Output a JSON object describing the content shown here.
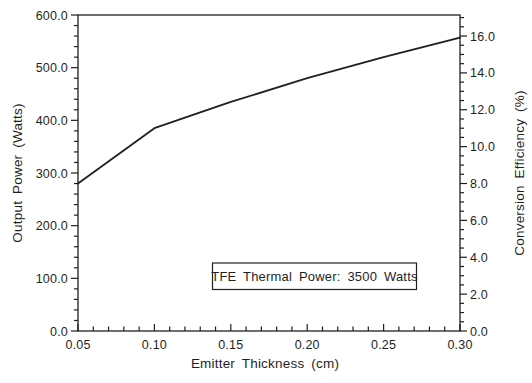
{
  "chart_data": {
    "type": "line",
    "title": "",
    "xlabel": "Emitter Thickness (cm)",
    "ylabel_left": "Output Power (Watts)",
    "ylabel_right": "Conversion Efficiency (%)",
    "annotation": "TFE Thermal Power: 3500 Watts",
    "x": [
      0.05,
      0.1,
      0.15,
      0.2,
      0.25,
      0.3
    ],
    "series": [
      {
        "name": "Output Power",
        "values": [
          280,
          385,
          435,
          480,
          520,
          557
        ]
      }
    ],
    "xlim": [
      0.05,
      0.3
    ],
    "ylim_left": [
      0.0,
      600.0
    ],
    "ylim_right": [
      0.0,
      17.14
    ],
    "x_tick_labels": [
      "0.05",
      "0.10",
      "0.15",
      "0.20",
      "0.25",
      "0.30"
    ],
    "yleft_tick_labels": [
      "0.0",
      "100.0",
      "200.0",
      "300.0",
      "400.0",
      "500.0",
      "600.0"
    ],
    "yright_tick_labels": [
      "0.0",
      "2.0",
      "4.0",
      "6.0",
      "8.0",
      "10.0",
      "12.0",
      "14.0",
      "16.0"
    ],
    "x_minor_step": 0.01,
    "yleft_minor_step": 20,
    "yright_minor_step": 0.5,
    "grid": false,
    "legend": "none",
    "line_color": "#1f1f1f",
    "background_color": "#ffffff"
  }
}
